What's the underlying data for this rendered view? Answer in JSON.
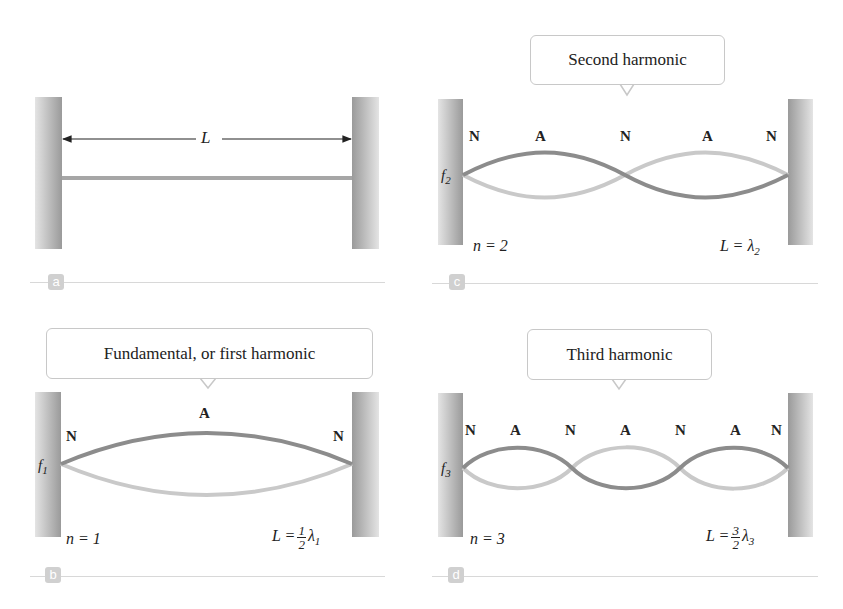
{
  "panels": {
    "a": {
      "tag": "a",
      "length_label": "L"
    },
    "b": {
      "tag": "b",
      "callout": "Fundamental, or first harmonic",
      "freq_label": "f",
      "freq_sub": "1",
      "nodes": [
        "N",
        "A",
        "N"
      ],
      "n_label": "n = 1",
      "L_prefix": "L =",
      "L_num": "1",
      "L_den": "2",
      "L_lambda": "λ",
      "L_sub": "1"
    },
    "c": {
      "tag": "c",
      "callout": "Second harmonic",
      "freq_label": "f",
      "freq_sub": "2",
      "nodes": [
        "N",
        "A",
        "N",
        "A",
        "N"
      ],
      "n_label": "n = 2",
      "L_prefix": "L = λ",
      "L_sub": "2"
    },
    "d": {
      "tag": "d",
      "callout": "Third harmonic",
      "freq_label": "f",
      "freq_sub": "3",
      "nodes": [
        "N",
        "A",
        "N",
        "A",
        "N",
        "A",
        "N"
      ],
      "n_label": "n = 3",
      "L_prefix": "L =",
      "L_num": "3",
      "L_den": "2",
      "L_lambda": "λ",
      "L_sub": "3"
    }
  },
  "colors": {
    "string_dark": "#8c8c8c",
    "string_light": "#c9c9c9",
    "wall_outer": "#e2e2e2",
    "wall_inner": "#9a9a9a"
  }
}
